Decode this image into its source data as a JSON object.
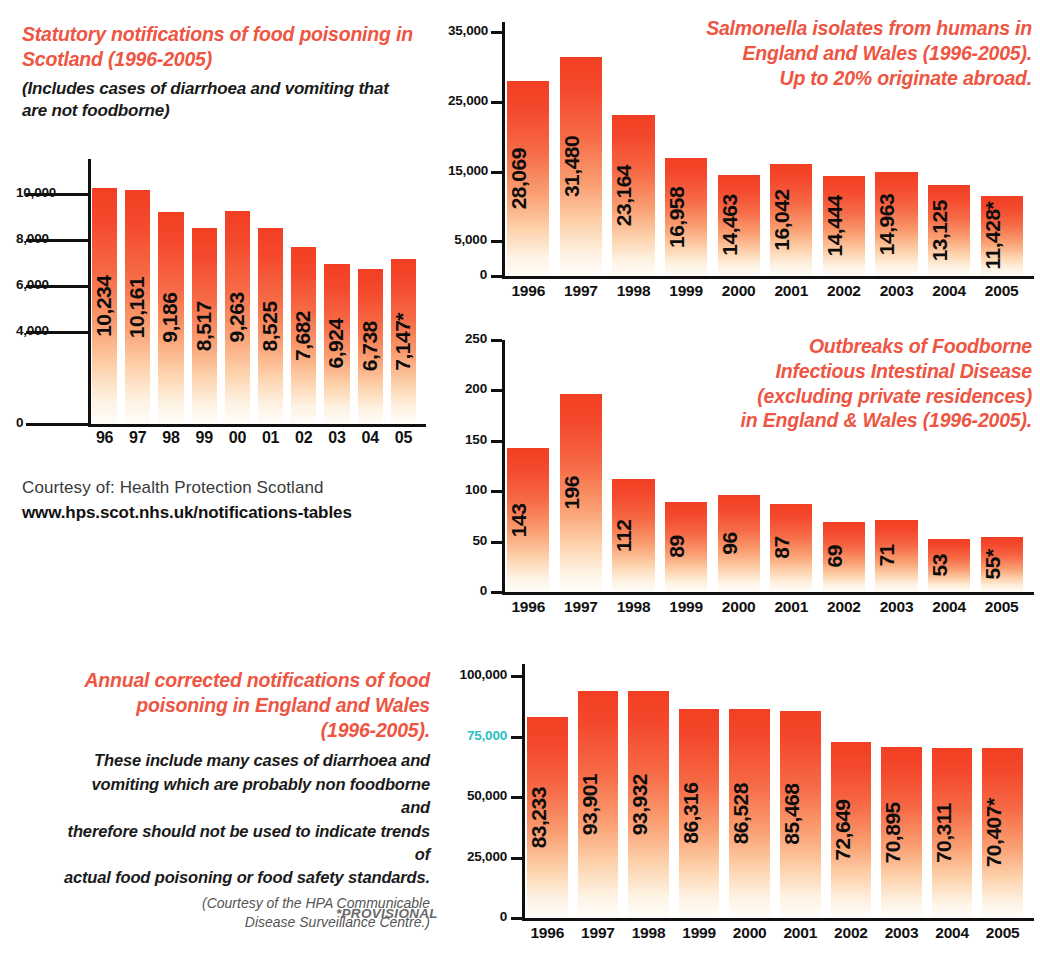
{
  "chart_data": [
    {
      "id": "scotland",
      "type": "bar",
      "title": "Statutory notifications of food poisoning in Scotland (1996-2005)",
      "subtitle": "(Includes cases of diarrhoea and vomiting that are not foodborne)",
      "categories": [
        "96",
        "97",
        "98",
        "99",
        "00",
        "01",
        "02",
        "03",
        "04",
        "05"
      ],
      "values": [
        10234,
        10161,
        9186,
        8517,
        9263,
        8525,
        7682,
        6924,
        6738,
        7147
      ],
      "value_labels": [
        "10,234",
        "10,161",
        "9,186",
        "8,517",
        "9,263",
        "8,525",
        "7,682",
        "6,924",
        "6,738",
        "7,147*"
      ],
      "yticks": [
        0,
        4000,
        6000,
        8000,
        10000
      ],
      "ytick_labels": [
        "0",
        "4,000",
        "6,000",
        "8,000",
        "10,000"
      ],
      "ylim": [
        0,
        11500
      ],
      "xlabel": "",
      "ylabel": "",
      "grid": false,
      "legend": "none",
      "credit_line1": "Courtesy of: Health Protection Scotland",
      "credit_line2": "www.hps.scot.nhs.uk/notifications-tables"
    },
    {
      "id": "salmonella",
      "type": "bar",
      "title": "Salmonella isolates from humans in England and Wales (1996-2005). Up to 20% originate abroad.",
      "title_lines": [
        "Salmonella isolates from humans in",
        "England and Wales (1996-2005).",
        "Up to 20% originate abroad."
      ],
      "categories": [
        "1996",
        "1997",
        "1998",
        "1999",
        "2000",
        "2001",
        "2002",
        "2003",
        "2004",
        "2005"
      ],
      "values": [
        28069,
        31480,
        23164,
        16958,
        14463,
        16042,
        14444,
        14963,
        13125,
        11428
      ],
      "value_labels": [
        "28,069",
        "31,480",
        "23,164",
        "16,958",
        "14,463",
        "16,042",
        "14,444",
        "14,963",
        "13,125",
        "11,428*"
      ],
      "yticks": [
        0,
        5000,
        15000,
        25000,
        35000
      ],
      "ytick_labels": [
        "0",
        "5,000",
        "15,000",
        "25,000",
        "35,000"
      ],
      "ylim": [
        0,
        36500
      ],
      "xlabel": "",
      "ylabel": "",
      "grid": false,
      "legend": "none"
    },
    {
      "id": "outbreaks",
      "type": "bar",
      "title": "Outbreaks of Foodborne Infectious Intestinal Disease (excluding private residences) in England & Wales (1996-2005).",
      "title_lines": [
        "Outbreaks of Foodborne",
        "Infectious Intestinal Disease",
        "(excluding private residences)",
        "in England & Wales (1996-2005)."
      ],
      "categories": [
        "1996",
        "1997",
        "1998",
        "1999",
        "2000",
        "2001",
        "2002",
        "2003",
        "2004",
        "2005"
      ],
      "values": [
        143,
        196,
        112,
        89,
        96,
        87,
        69,
        71,
        53,
        55
      ],
      "value_labels": [
        "143",
        "196",
        "112",
        "89",
        "96",
        "87",
        "69",
        "71",
        "53",
        "55*"
      ],
      "yticks": [
        0,
        50,
        100,
        150,
        200,
        250
      ],
      "ytick_labels": [
        "0",
        "50",
        "100",
        "150",
        "200",
        "250"
      ],
      "ylim": [
        0,
        250
      ],
      "xlabel": "",
      "ylabel": "",
      "grid": false,
      "legend": "none"
    },
    {
      "id": "england-wales",
      "type": "bar",
      "title": "Annual corrected notifications of food poisoning in England and Wales (1996-2005).",
      "title_lines": [
        "Annual corrected notifications of food",
        "poisoning in England and Wales",
        "(1996-2005)."
      ],
      "body_lines": [
        "These include many cases of diarrhoea and",
        "vomiting which are probably non foodborne and",
        "therefore should not be used to indicate trends of",
        "actual food poisoning or food safety standards."
      ],
      "source_lines": [
        "(Courtesy of the HPA Communicable",
        "Disease Surveillance Centre.)"
      ],
      "footnote": "*PROVISIONAL",
      "categories": [
        "1996",
        "1997",
        "1998",
        "1999",
        "2000",
        "2001",
        "2002",
        "2003",
        "2004",
        "2005"
      ],
      "values": [
        83233,
        93901,
        93932,
        86316,
        86528,
        85468,
        72649,
        70895,
        70311,
        70407
      ],
      "value_labels": [
        "83,233",
        "93,901",
        "93,932",
        "86,316",
        "86,528",
        "85,468",
        "72,649",
        "70,895",
        "70,311",
        "70,407*"
      ],
      "yticks": [
        0,
        25000,
        50000,
        75000,
        100000
      ],
      "ytick_labels": [
        "0",
        "25,000",
        "50,000",
        "75,000",
        "100,000"
      ],
      "ylim": [
        0,
        105000
      ],
      "xlabel": "",
      "ylabel": "",
      "grid": false,
      "legend": "none"
    }
  ],
  "colors": {
    "accent_red": "#ee5542",
    "bar_top": "#f23f22",
    "bar_bottom": "#fffdfa",
    "axis": "#101010",
    "teal_label": "#2bbfc4"
  }
}
